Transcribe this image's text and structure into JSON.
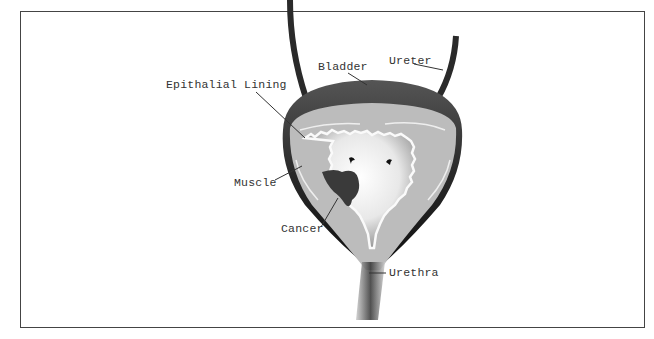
{
  "diagram": {
    "labels": {
      "bladder": "Bladder",
      "ureter": "Ureter",
      "epithelial_lining": "Epithalial Lining",
      "muscle": "Muscle",
      "cancer": "Cancer",
      "urethra": "Urethra"
    },
    "colors": {
      "outer_wall": "#2a2a2a",
      "muscle": "#b8b8b8",
      "lumen": "#f0f0f0",
      "tumor": "#3a3a3a",
      "border": "#444444",
      "text": "#333333"
    }
  }
}
